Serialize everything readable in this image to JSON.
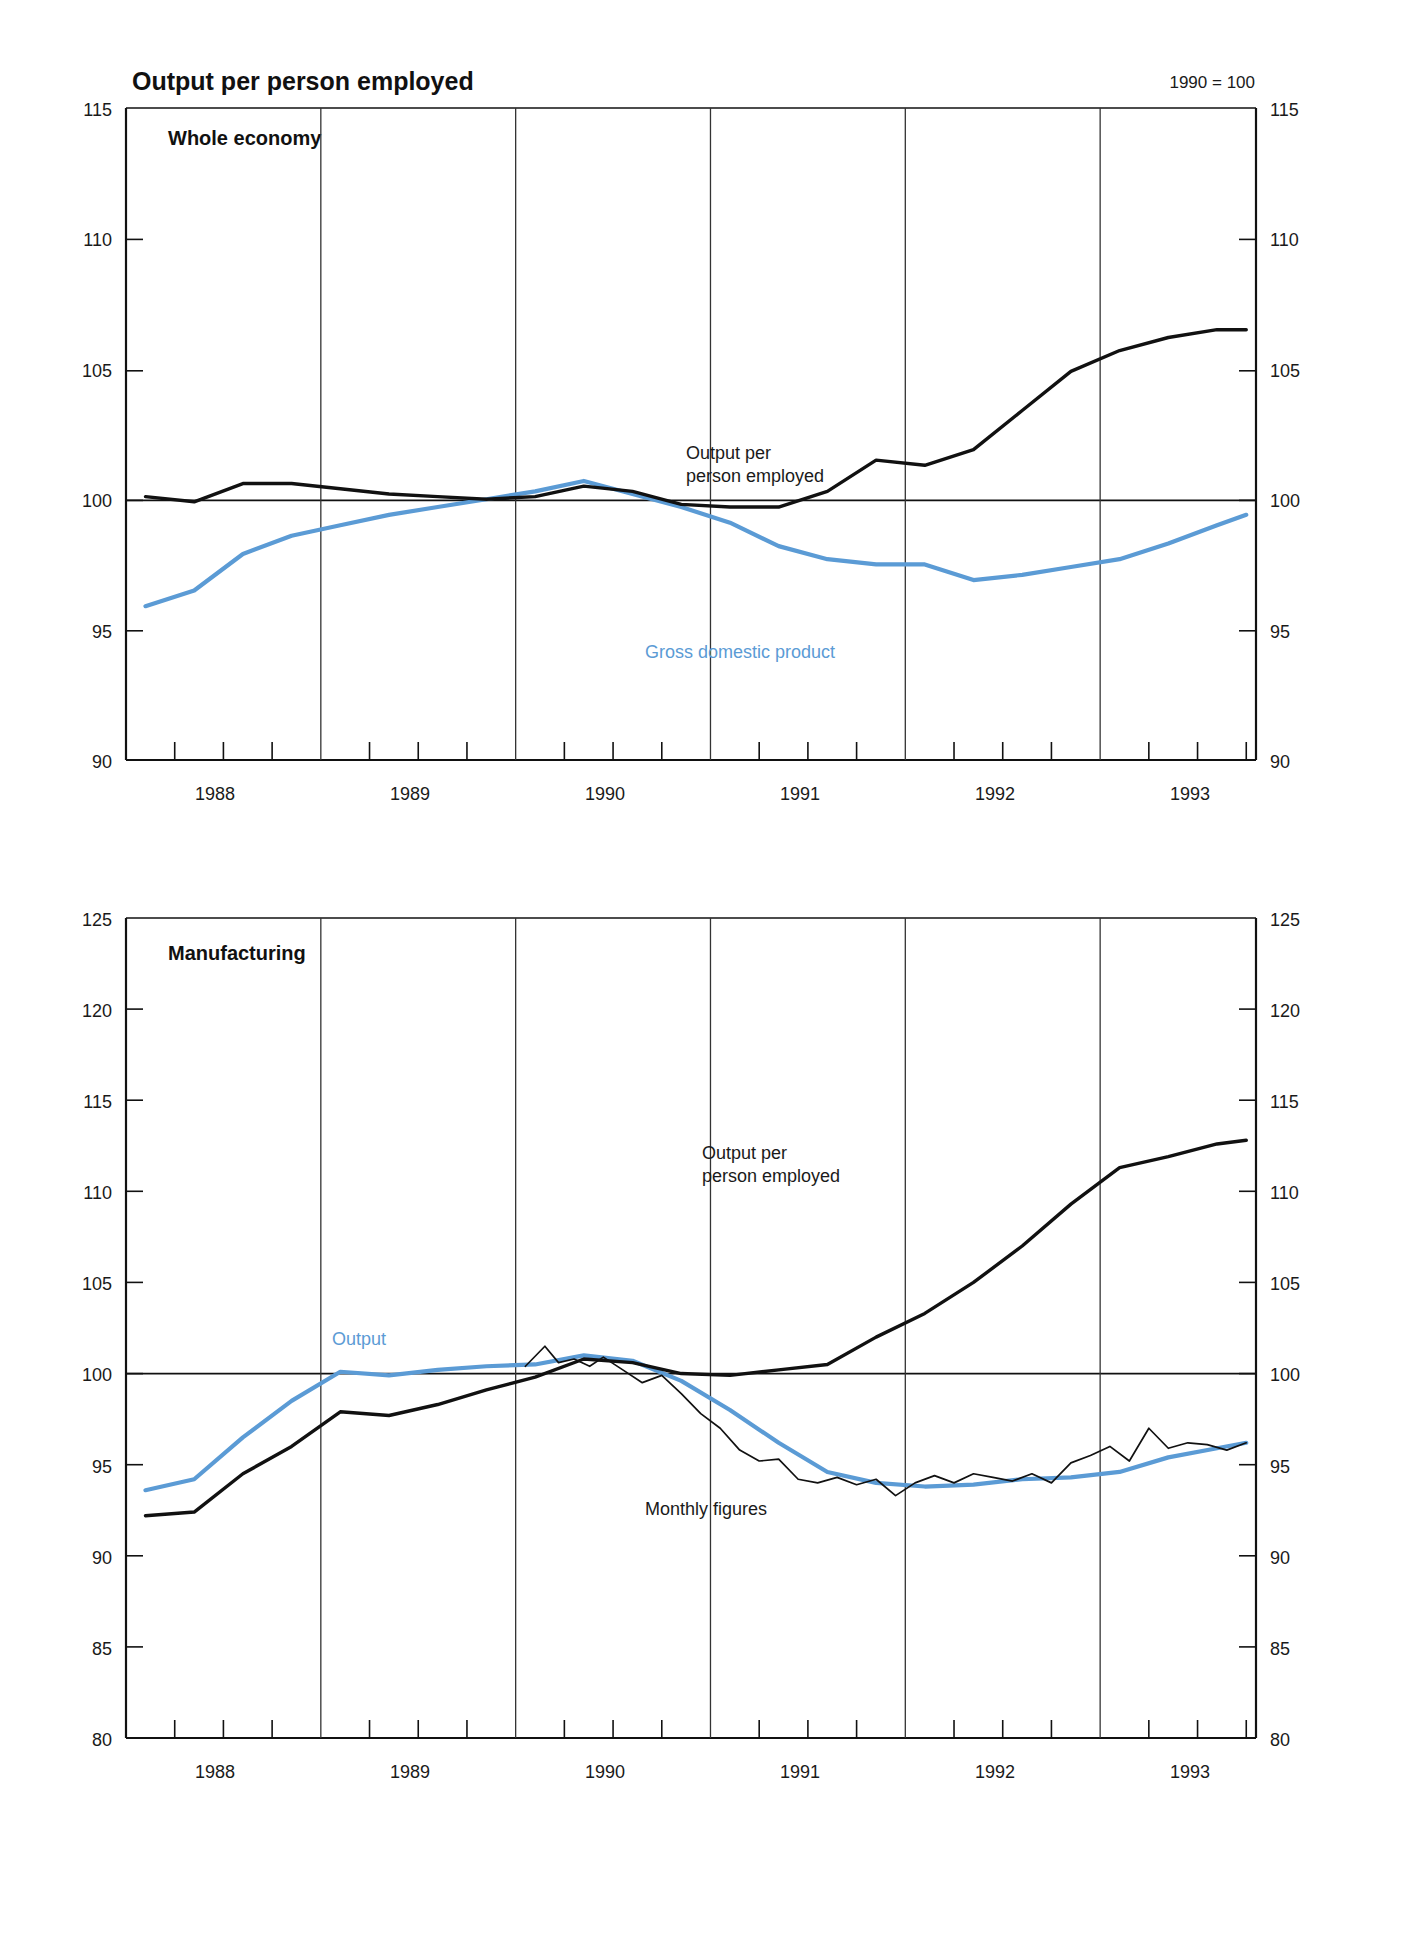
{
  "figure": {
    "title": "Output per person employed",
    "note": "1990 = 100"
  },
  "panels": {
    "whole_economy": {
      "title": "Whole economy",
      "labels": {
        "output_line1": "Output per",
        "output_line2": "person employed",
        "gdp": "Gross domestic product"
      },
      "y_ticks": [
        "115",
        "110",
        "105",
        "100",
        "95",
        "90"
      ],
      "x_ticks": [
        "1988",
        "1989",
        "1990",
        "1991",
        "1992",
        "1993"
      ]
    },
    "manufacturing": {
      "title": "Manufacturing",
      "labels": {
        "output_line1": "Output per",
        "output_line2": "person employed",
        "output": "Output",
        "monthly": "Monthly figures"
      },
      "y_ticks": [
        "125",
        "120",
        "115",
        "110",
        "105",
        "100",
        "95",
        "90",
        "85",
        "80"
      ],
      "x_ticks": [
        "1988",
        "1989",
        "1990",
        "1991",
        "1992",
        "1993"
      ]
    }
  },
  "colors": {
    "black_series": "#111111",
    "blue_series": "#5b9bd5",
    "axis": "#111111",
    "background": "#ffffff"
  },
  "chart_data": [
    {
      "type": "line",
      "title": "Output per person employed",
      "subtitle": "Whole economy",
      "note": "1990 = 100",
      "xlabel": "",
      "ylabel": "",
      "ylim": [
        90,
        115
      ],
      "xlim": [
        1987.5,
        1993.3
      ],
      "grid": "vertical-midyear",
      "legend": "inline-annotations",
      "y_ticks": [
        90,
        95,
        100,
        105,
        110,
        115
      ],
      "x_ticks": [
        1988,
        1989,
        1990,
        1991,
        1992,
        1993
      ],
      "baseline": 100,
      "series": [
        {
          "name": "Output per person employed",
          "color": "#111111",
          "x": [
            1987.6,
            1987.85,
            1988.1,
            1988.35,
            1988.6,
            1988.85,
            1989.1,
            1989.35,
            1989.6,
            1989.85,
            1990.1,
            1990.35,
            1990.6,
            1990.85,
            1991.1,
            1991.35,
            1991.6,
            1991.85,
            1992.1,
            1992.35,
            1992.6,
            1992.85,
            1993.1,
            1993.25
          ],
          "values": [
            100.1,
            99.9,
            100.6,
            100.6,
            100.4,
            100.2,
            100.1,
            100.0,
            100.1,
            100.5,
            100.3,
            99.8,
            99.7,
            99.7,
            100.3,
            101.5,
            101.3,
            101.9,
            103.4,
            104.9,
            105.7,
            106.2,
            106.5,
            106.5
          ]
        },
        {
          "name": "Gross domestic product",
          "color": "#5b9bd5",
          "x": [
            1987.6,
            1987.85,
            1988.1,
            1988.35,
            1988.6,
            1988.85,
            1989.1,
            1989.35,
            1989.6,
            1989.85,
            1990.1,
            1990.35,
            1990.6,
            1990.85,
            1991.1,
            1991.35,
            1991.6,
            1991.85,
            1992.1,
            1992.35,
            1992.6,
            1992.85,
            1993.1,
            1993.25
          ],
          "values": [
            95.9,
            96.5,
            97.9,
            98.6,
            99.0,
            99.4,
            99.7,
            100.0,
            100.3,
            100.7,
            100.2,
            99.7,
            99.1,
            98.2,
            97.7,
            97.5,
            97.5,
            96.9,
            97.1,
            97.4,
            97.7,
            98.3,
            99.0,
            99.4
          ]
        }
      ],
      "annotations": [
        {
          "text": "Output per person employed",
          "x": 1991.25,
          "y": 103.9,
          "color": "#111111"
        },
        {
          "text": "Gross domestic product",
          "x": 1991.4,
          "y": 96.0,
          "color": "#5b9bd5"
        }
      ]
    },
    {
      "type": "line",
      "title": "Output per person employed",
      "subtitle": "Manufacturing",
      "note": "1990 = 100",
      "xlabel": "",
      "ylabel": "",
      "ylim": [
        80,
        125
      ],
      "xlim": [
        1987.5,
        1993.3
      ],
      "grid": "vertical-midyear",
      "legend": "inline-annotations",
      "y_ticks": [
        80,
        85,
        90,
        95,
        100,
        105,
        110,
        115,
        120,
        125
      ],
      "x_ticks": [
        1988,
        1989,
        1990,
        1991,
        1992,
        1993
      ],
      "baseline": 100,
      "series": [
        {
          "name": "Output per person employed",
          "color": "#111111",
          "x": [
            1987.6,
            1987.85,
            1988.1,
            1988.35,
            1988.6,
            1988.85,
            1989.1,
            1989.35,
            1989.6,
            1989.85,
            1990.1,
            1990.35,
            1990.6,
            1990.85,
            1991.1,
            1991.35,
            1991.6,
            1991.85,
            1992.1,
            1992.35,
            1992.6,
            1992.85,
            1993.1,
            1993.25
          ],
          "values": [
            92.2,
            92.4,
            94.5,
            96.0,
            97.9,
            97.7,
            98.3,
            99.1,
            99.8,
            100.8,
            100.6,
            100.0,
            99.9,
            100.2,
            100.5,
            102.0,
            103.3,
            105.0,
            107.0,
            109.3,
            111.3,
            111.9,
            112.6,
            112.8
          ]
        },
        {
          "name": "Output",
          "color": "#5b9bd5",
          "x": [
            1987.6,
            1987.85,
            1988.1,
            1988.35,
            1988.6,
            1988.85,
            1989.1,
            1989.35,
            1989.6,
            1989.85,
            1990.1,
            1990.35,
            1990.6,
            1990.85,
            1991.1,
            1991.35,
            1991.6,
            1991.85,
            1992.1,
            1992.35,
            1992.6,
            1992.85,
            1993.1,
            1993.25
          ],
          "values": [
            93.6,
            94.2,
            96.5,
            98.5,
            100.1,
            99.9,
            100.2,
            100.4,
            100.5,
            101.0,
            100.7,
            99.6,
            98.0,
            96.2,
            94.6,
            94.0,
            93.8,
            93.9,
            94.2,
            94.3,
            94.6,
            95.4,
            95.9,
            96.2
          ]
        },
        {
          "name": "Monthly figures",
          "color": "#111111",
          "x": [
            1989.55,
            1989.65,
            1989.72,
            1989.8,
            1989.88,
            1989.95,
            1990.05,
            1990.15,
            1990.25,
            1990.35,
            1990.45,
            1990.55,
            1990.65,
            1990.75,
            1990.85,
            1990.95,
            1991.05,
            1991.15,
            1991.25,
            1991.35,
            1991.45,
            1991.55,
            1991.65,
            1991.75,
            1991.85,
            1991.95,
            1992.05,
            1992.15,
            1992.25,
            1992.35,
            1992.45,
            1992.55,
            1992.65,
            1992.75,
            1992.85,
            1992.95,
            1993.05,
            1993.15,
            1993.25
          ],
          "values": [
            100.4,
            101.5,
            100.6,
            100.8,
            100.4,
            100.9,
            100.2,
            99.5,
            99.9,
            98.9,
            97.8,
            97.0,
            95.8,
            95.2,
            95.3,
            94.2,
            94.0,
            94.3,
            93.9,
            94.2,
            93.3,
            94.0,
            94.4,
            94.0,
            94.5,
            94.3,
            94.1,
            94.5,
            94.0,
            95.1,
            95.5,
            96.0,
            95.2,
            97.0,
            95.9,
            96.2,
            96.1,
            95.8,
            96.2
          ]
        }
      ],
      "annotations": [
        {
          "text": "Output per person employed",
          "x": 1991.0,
          "y": 107.0,
          "color": "#111111"
        },
        {
          "text": "Output",
          "x": 1988.9,
          "y": 101.5,
          "color": "#5b9bd5"
        },
        {
          "text": "Monthly figures",
          "x": 1990.85,
          "y": 92.2,
          "color": "#111111"
        }
      ]
    }
  ]
}
